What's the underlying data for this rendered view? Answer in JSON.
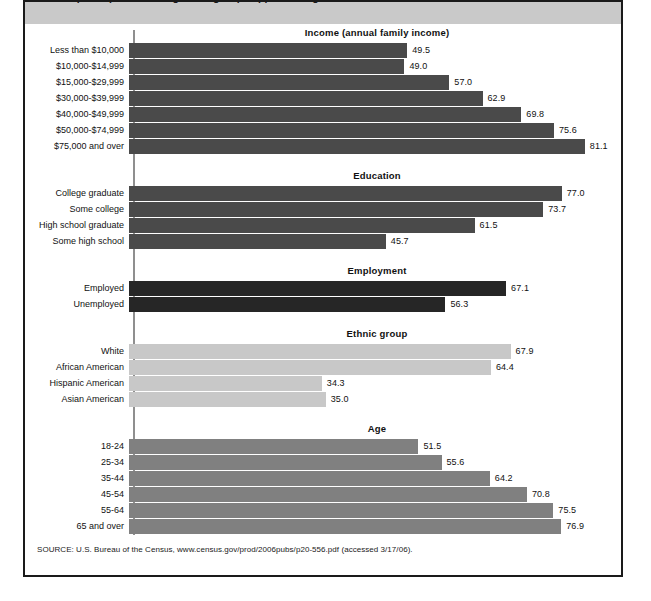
{
  "header": {
    "title_clipped": "rates of participation among these groups appear in Figure 1"
  },
  "source": "SOURCE: U.S. Bureau of the Census, www.census.gov/prod/2006pubs/p20-556.pdf (accessed 3/17/06).",
  "chart_data": {
    "type": "bar",
    "orientation": "horizontal",
    "title": "",
    "xlabel": "",
    "ylabel": "",
    "xlim": [
      0,
      100
    ],
    "grid": false,
    "legend": "none",
    "value_label_format": "one decimal",
    "groups": [
      {
        "name": "Income (annual family income)",
        "color": "#4a4a4a",
        "categories": [
          "Less than $10,000",
          "$10,000-$14,999",
          "$15,000-$29,999",
          "$30,000-$39,999",
          "$40,000-$49,999",
          "$50,000-$74,999",
          "$75,000 and over"
        ],
        "values": [
          49.5,
          49.0,
          57.0,
          62.9,
          69.8,
          75.6,
          81.1
        ],
        "value_labels": [
          "49.5",
          "49.0",
          "57.0",
          "62.9",
          "69.8",
          "75.6",
          "81.1"
        ]
      },
      {
        "name": "Education",
        "color": "#4a4a4a",
        "categories": [
          "College graduate",
          "Some college",
          "High school graduate",
          "Some high school"
        ],
        "values": [
          77.0,
          73.7,
          61.5,
          45.7
        ],
        "value_labels": [
          "77.0",
          "73.7",
          "61.5",
          "45.7"
        ]
      },
      {
        "name": "Employment",
        "color": "#262626",
        "categories": [
          "Employed",
          "Unemployed"
        ],
        "values": [
          67.1,
          56.3
        ],
        "value_labels": [
          "67.1",
          "56.3"
        ]
      },
      {
        "name": "Ethnic group",
        "color": "#c8c8c8",
        "categories": [
          "White",
          "African American",
          "Hispanic American",
          "Asian American"
        ],
        "values": [
          67.9,
          64.4,
          34.3,
          35.0
        ],
        "value_labels": [
          "67.9",
          "64.4",
          "34.3",
          "35.0"
        ]
      },
      {
        "name": "Age",
        "color": "#808080",
        "categories": [
          "18-24",
          "25-34",
          "35-44",
          "45-54",
          "55-64",
          "65 and over"
        ],
        "values": [
          51.5,
          55.6,
          64.2,
          70.8,
          75.5,
          76.9
        ],
        "value_labels": [
          "51.5",
          "55.6",
          "64.2",
          "70.8",
          "75.5",
          "76.9"
        ]
      }
    ]
  }
}
